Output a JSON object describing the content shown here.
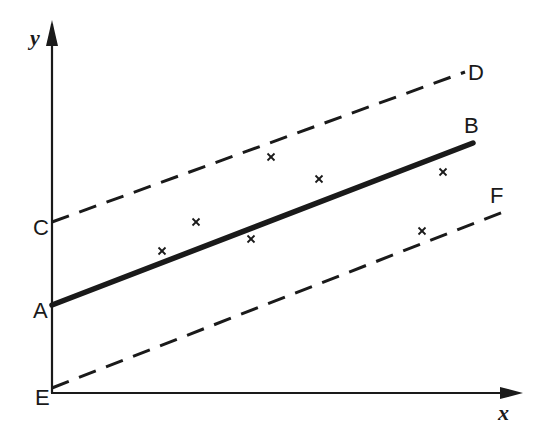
{
  "diagram": {
    "colors": {
      "ink": "#1a1a1a",
      "background": "#ffffff"
    },
    "axes": {
      "x_label": "x",
      "y_label": "y",
      "origin": [
        52,
        393
      ],
      "x_tip": [
        522,
        393
      ],
      "y_tip": [
        52,
        22
      ]
    },
    "lines": [
      {
        "name": "regression-line-AB",
        "style": "solid-thick",
        "start_label": "A",
        "end_label": "B",
        "start": [
          52,
          305
        ],
        "end": [
          473,
          143
        ]
      },
      {
        "name": "upper-bound-CD",
        "style": "dashed",
        "start_label": "C",
        "end_label": "D",
        "start": [
          52,
          222
        ],
        "end": [
          465,
          72
        ]
      },
      {
        "name": "lower-bound-EF",
        "style": "dashed",
        "start_label": "E",
        "end_label": "F",
        "start": [
          52,
          388
        ],
        "end": [
          503,
          212
        ]
      }
    ],
    "point_labels": {
      "A": "A",
      "B": "B",
      "C": "C",
      "D": "D",
      "E": "E",
      "F": "F"
    },
    "data_points": [
      {
        "x": 162,
        "y": 251
      },
      {
        "x": 196,
        "y": 222
      },
      {
        "x": 251,
        "y": 239
      },
      {
        "x": 271,
        "y": 157
      },
      {
        "x": 319,
        "y": 179
      },
      {
        "x": 422,
        "y": 231
      },
      {
        "x": 443,
        "y": 172
      }
    ],
    "marker_symbol": "×"
  }
}
